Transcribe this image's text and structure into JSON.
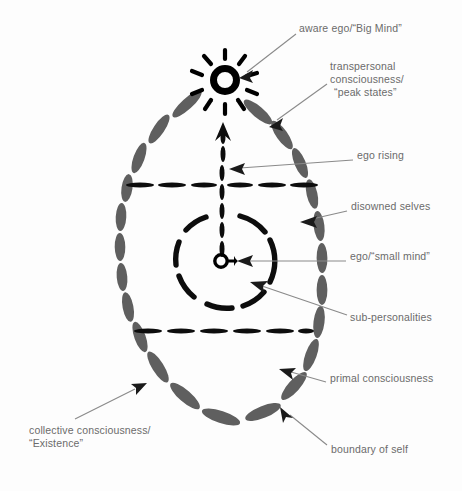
{
  "figure": {
    "colors": {
      "oval_dash": "#5f5f5f",
      "inner_dash": "#0d0d0d",
      "sun": "#000000",
      "label_text": "#6b6b6b",
      "leader_line": "#8a8a8a",
      "background": "#ffffff"
    }
  },
  "labels": [
    {
      "id": "aware-ego",
      "text": "aware ego/“Big Mind”",
      "x": 299,
      "y": 28
    },
    {
      "id": "transpersonal-line-1",
      "text": "transpersonal",
      "x": 330,
      "y": 66
    },
    {
      "id": "transpersonal-line-2",
      "text": "consciousness/",
      "x": 330,
      "y": 79
    },
    {
      "id": "transpersonal-line-3",
      "text": "“peak states”",
      "x": 334,
      "y": 92
    },
    {
      "id": "ego-rising",
      "text": "ego rising",
      "x": 357,
      "y": 155
    },
    {
      "id": "disowned-selves",
      "text": "disowned selves",
      "x": 351,
      "y": 206
    },
    {
      "id": "ego-small-mind",
      "text": "ego/“small mind”",
      "x": 350,
      "y": 256
    },
    {
      "id": "sub-personalities",
      "text": "sub-personalities",
      "x": 350,
      "y": 317
    },
    {
      "id": "primal-consciousness",
      "text": "primal consciousness",
      "x": 330,
      "y": 378
    },
    {
      "id": "collective-line-1",
      "text": "collective consciousness/",
      "x": 29,
      "y": 430
    },
    {
      "id": "collective-line-2",
      "text": "“Existence”",
      "x": 29,
      "y": 443
    },
    {
      "id": "boundary-of-self",
      "text": "boundary of self",
      "x": 331,
      "y": 449
    }
  ],
  "diagram_data": {
    "type": "diagram",
    "description": "Concentric hand-drawn model of the self: a dashed gray egg-shaped boundary of self, two black dashed horizontal divider lines, a black dashed inner circle of sub-personalities, the ego as a tiny circle at center, a dashed arrow rising from the ego to a radiant sun at the top representing the aware ego / Big Mind.",
    "ego_center": {
      "x": 222,
      "y": 261
    },
    "sun_center": {
      "x": 225,
      "y": 80
    },
    "oval": {
      "cx": 221,
      "cy": 258,
      "rx": 100,
      "ry": 172
    },
    "inner_circle": {
      "cx": 223,
      "cy": 261,
      "r": 48
    },
    "divider_upper_y": 185,
    "divider_lower_y": 331,
    "rising_arrow": {
      "from_x": 222,
      "from_y": 258,
      "to_x": 223,
      "to_y": 124
    }
  }
}
